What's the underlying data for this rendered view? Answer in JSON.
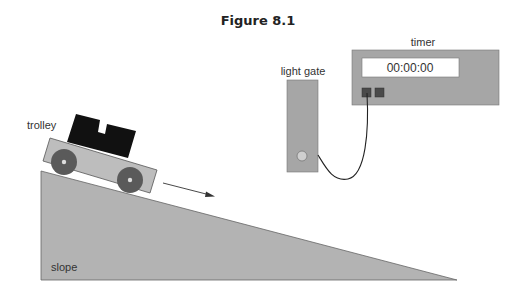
{
  "figure": {
    "title": "Figure 8.1"
  },
  "labels": {
    "trolley": "trolley",
    "slope": "slope",
    "light_gate": "light gate",
    "timer": "timer"
  },
  "timer": {
    "display": "00:00:00"
  },
  "colors": {
    "slope_fill": "#b3b3b3",
    "trolley_body": "#bdbdbd",
    "wheel": "#5a5a5a",
    "block": "#111111",
    "device_fill": "#a6a6a6",
    "display_bg": "#ffffff",
    "button": "#4a4a4a",
    "outline": "#555555"
  },
  "icons": {
    "motion_arrow": "arrow-right-down"
  }
}
